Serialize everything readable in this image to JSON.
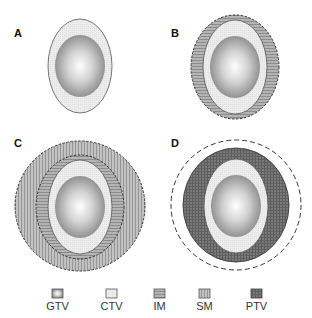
{
  "figure": {
    "panels": [
      {
        "id": "A",
        "label": "A",
        "structures": [
          "GTV",
          "CTV"
        ]
      },
      {
        "id": "B",
        "label": "B",
        "structures": [
          "GTV",
          "CTV",
          "IM"
        ]
      },
      {
        "id": "C",
        "label": "C",
        "structures": [
          "GTV",
          "CTV",
          "IM",
          "SM"
        ]
      },
      {
        "id": "D",
        "label": "D",
        "structures": [
          "GTV",
          "CTV",
          "PTV"
        ]
      }
    ],
    "legend": [
      {
        "key": "GTV",
        "label": "GTV",
        "color": "#8e8e8e"
      },
      {
        "key": "CTV",
        "label": "CTV",
        "color": "#ececec"
      },
      {
        "key": "IM",
        "label": "IM",
        "color": "#a6a6a6"
      },
      {
        "key": "SM",
        "label": "SM",
        "color": "#b0b0b0"
      },
      {
        "key": "PTV",
        "label": "PTV",
        "color": "#6a6a6a"
      }
    ],
    "colors": {
      "gtv_center": "#ffffff",
      "gtv_edge": "#8a8a8a",
      "ctv_fill": "#ececec",
      "im_fill": "#a4a4a4",
      "sm_fill": "#b3b3b3",
      "ptv_fill": "#707070",
      "outline": "#444444"
    }
  }
}
